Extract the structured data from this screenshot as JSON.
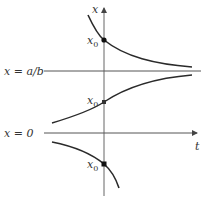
{
  "diagram": {
    "axis_labels": {
      "vertical": "x",
      "horizontal": "t"
    },
    "lines": {
      "equilibrium_upper": "x = a/b",
      "equilibrium_lower": "x = 0"
    },
    "points": [
      {
        "label": "x",
        "subscript": "0",
        "curve": "upper"
      },
      {
        "label": "x",
        "subscript": "0",
        "curve": "middle"
      },
      {
        "label": "x",
        "subscript": "0",
        "curve": "lower"
      }
    ],
    "colors": {
      "stroke": "#2a2a2a",
      "axis": "#555555"
    }
  }
}
